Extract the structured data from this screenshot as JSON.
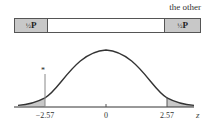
{
  "top": {
    "caption": "the other",
    "left_segment": {
      "fraction": "½",
      "symbol": "P"
    },
    "right_segment": {
      "fraction": "½",
      "symbol": "P"
    }
  },
  "curve": {
    "marker": "*",
    "axis_label": "z",
    "ticks": [
      {
        "value": -2.57,
        "label": "−2.57"
      },
      {
        "value": 0,
        "label": "0"
      },
      {
        "value": 2.57,
        "label": "2.57"
      }
    ],
    "shade_color": "#c8c8c8",
    "line_color": "#333333"
  }
}
